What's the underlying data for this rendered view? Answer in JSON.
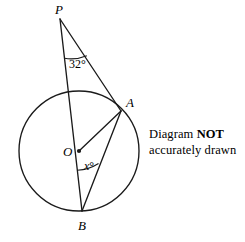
{
  "figure": {
    "stroke_color": "#1a1a1a",
    "background": "#ffffff",
    "circle": {
      "cx": 79,
      "cy": 151,
      "r": 60
    },
    "points": {
      "P": {
        "x": 60,
        "y": 19,
        "label": "P"
      },
      "A": {
        "x": 121,
        "y": 111,
        "label": "A"
      },
      "O": {
        "x": 79,
        "y": 151,
        "label": "O"
      },
      "B": {
        "x": 82,
        "y": 211,
        "label": "B"
      }
    },
    "segments": [
      {
        "name": "PB",
        "from": "P",
        "to": "B"
      },
      {
        "name": "PA-extended-to-B",
        "from": "P",
        "to": "B",
        "via": "A"
      },
      {
        "name": "OA",
        "from": "O",
        "to": "A"
      },
      {
        "name": "AB",
        "from": "A",
        "to": "B"
      }
    ],
    "angles": [
      {
        "name": "angle-at-P",
        "vertex": "P",
        "label": "32°",
        "value": 32
      },
      {
        "name": "angle-at-B",
        "vertex": "B",
        "label": "x°",
        "variable": "x",
        "degree_symbol": "°"
      }
    ]
  },
  "note": {
    "line1_prefix": "Diagram ",
    "line1_bold": "NOT",
    "line2": "accurately drawn"
  }
}
